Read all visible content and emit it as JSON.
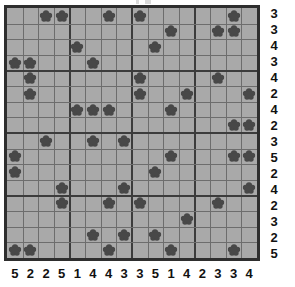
{
  "puzzle": {
    "type": "flower-placement-grid",
    "grid_size": {
      "rows": 16,
      "cols": 16
    },
    "colors": {
      "cell_background": "#a9a9a9",
      "gridline": "#6d6d6d",
      "gridline_major": "#3c3c3c",
      "border": "#2e2e2e",
      "flower": "#484848",
      "clue_text": "#111111",
      "page_background": "#ffffff"
    },
    "flower_icon_name": "flower-icon",
    "row_clues": [
      3,
      3,
      4,
      3,
      4,
      2,
      4,
      2,
      3,
      5,
      2,
      4,
      2,
      3,
      2,
      5
    ],
    "col_clues": [
      5,
      2,
      2,
      5,
      1,
      4,
      4,
      3,
      3,
      5,
      1,
      4,
      2,
      3,
      3,
      4
    ],
    "flowers": [
      [
        0,
        2
      ],
      [
        0,
        3
      ],
      [
        0,
        6
      ],
      [
        0,
        8
      ],
      [
        0,
        14
      ],
      [
        1,
        10
      ],
      [
        1,
        13
      ],
      [
        1,
        14
      ],
      [
        2,
        4
      ],
      [
        2,
        9
      ],
      [
        3,
        0
      ],
      [
        3,
        1
      ],
      [
        3,
        5
      ],
      [
        4,
        1
      ],
      [
        4,
        8
      ],
      [
        4,
        13
      ],
      [
        5,
        1
      ],
      [
        5,
        8
      ],
      [
        5,
        11
      ],
      [
        5,
        15
      ],
      [
        6,
        4
      ],
      [
        6,
        5
      ],
      [
        6,
        6
      ],
      [
        6,
        10
      ],
      [
        7,
        14
      ],
      [
        7,
        15
      ],
      [
        8,
        2
      ],
      [
        8,
        5
      ],
      [
        8,
        7
      ],
      [
        9,
        0
      ],
      [
        9,
        10
      ],
      [
        9,
        14
      ],
      [
        9,
        15
      ],
      [
        10,
        0
      ],
      [
        10,
        9
      ],
      [
        11,
        3
      ],
      [
        11,
        7
      ],
      [
        11,
        15
      ],
      [
        12,
        3
      ],
      [
        12,
        6
      ],
      [
        12,
        8
      ],
      [
        12,
        13
      ],
      [
        13,
        11
      ],
      [
        14,
        5
      ],
      [
        14,
        7
      ],
      [
        14,
        9
      ],
      [
        15,
        0
      ],
      [
        15,
        1
      ],
      [
        15,
        6
      ],
      [
        15,
        10
      ],
      [
        15,
        14
      ]
    ]
  }
}
